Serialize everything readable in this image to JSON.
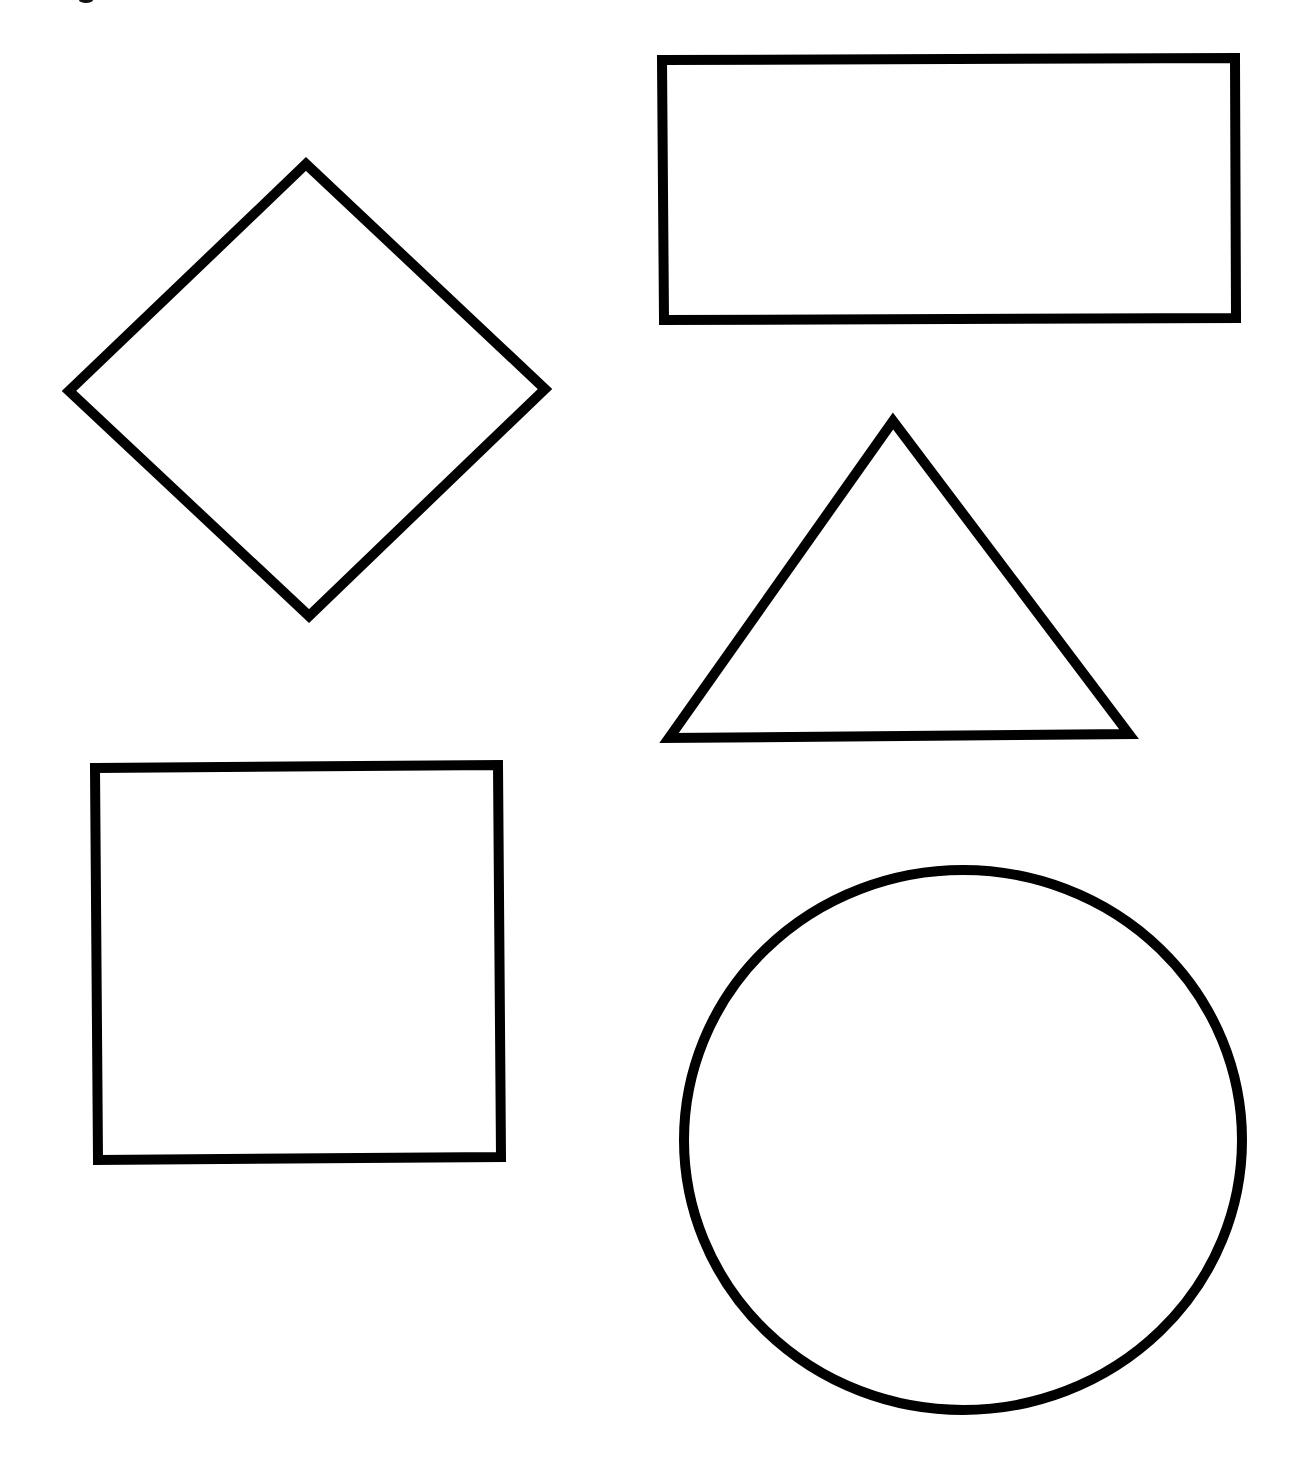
{
  "page": {
    "background": "#ffffff",
    "width": 1304,
    "height": 1473
  },
  "style": {
    "stroke_color": "#000000",
    "stroke_width": 10
  },
  "shapes": [
    {
      "id": "diamond",
      "type": "diamond",
      "label": "Diamond",
      "points": [
        [
          306,
          164
        ],
        [
          545,
          389
        ],
        [
          309,
          616
        ],
        [
          69,
          391
        ]
      ]
    },
    {
      "id": "rectangle",
      "type": "rectangle",
      "label": "Rectangle",
      "points": [
        [
          662,
          60
        ],
        [
          1235,
          58
        ],
        [
          1236,
          318
        ],
        [
          664,
          320
        ]
      ]
    },
    {
      "id": "triangle",
      "type": "triangle",
      "label": "Triangle",
      "points": [
        [
          893,
          421
        ],
        [
          1129,
          734
        ],
        [
          669,
          738
        ]
      ]
    },
    {
      "id": "square",
      "type": "square",
      "label": "Square",
      "points": [
        [
          95,
          768
        ],
        [
          498,
          765
        ],
        [
          501,
          1157
        ],
        [
          98,
          1160
        ]
      ]
    },
    {
      "id": "circle",
      "type": "circle",
      "label": "Circle",
      "cx": 963,
      "cy": 1140,
      "rx": 279,
      "ry": 270
    }
  ],
  "artifacts": [
    {
      "id": "top-edge-mark",
      "cx": 86,
      "cy": 0,
      "rx": 7,
      "ry": 3
    }
  ]
}
